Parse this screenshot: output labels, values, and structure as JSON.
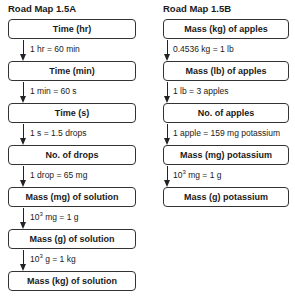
{
  "road_map_a": {
    "title": "Road Map 1.5A",
    "boxes": [
      "Time (hr)",
      "Time (min)",
      "Time (s)",
      "No. of drops",
      "Mass (mg) of solution",
      "Mass (g) of solution",
      "Mass (kg) of solution"
    ],
    "conversions": [
      {
        "pre": "",
        "sup": "",
        "post": "1 hr = 60 min"
      },
      {
        "pre": "",
        "sup": "",
        "post": "1 min = 60 s"
      },
      {
        "pre": "",
        "sup": "",
        "post": "1 s = 1.5 drops"
      },
      {
        "pre": "",
        "sup": "",
        "post": "1 drop = 65 mg"
      },
      {
        "pre": "10",
        "sup": "3",
        "post": " mg = 1 g"
      },
      {
        "pre": "10",
        "sup": "3",
        "post": " g = 1 kg"
      }
    ]
  },
  "road_map_b": {
    "title": "Road Map 1.5B",
    "boxes": [
      "Mass (kg) of apples",
      "Mass (lb) of apples",
      "No. of apples",
      "Mass (mg) potassium",
      "Mass (g) potassium"
    ],
    "conversions": [
      {
        "pre": "",
        "sup": "",
        "post": "0.4536 kg = 1 lb"
      },
      {
        "pre": "",
        "sup": "",
        "post": "1 lb = 3 apples"
      },
      {
        "pre": "",
        "sup": "",
        "post": "1 apple = 159 mg potassium"
      },
      {
        "pre": "10",
        "sup": "3",
        "post": " mg = 1 g"
      }
    ]
  }
}
